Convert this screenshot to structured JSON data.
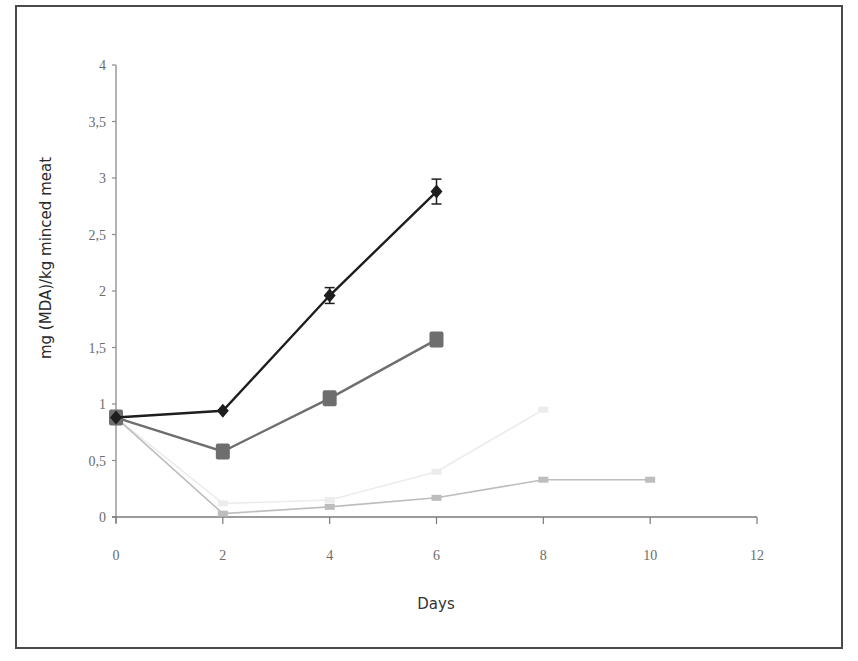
{
  "chart_data": {
    "type": "line",
    "title": "",
    "xlabel": "Days",
    "ylabel": "mg (MDA)/kg  minced meat",
    "xlim": [
      0,
      12
    ],
    "ylim": [
      0,
      4
    ],
    "x_ticks": [
      "0",
      "2",
      "4",
      "6",
      "8",
      "10",
      "12"
    ],
    "y_ticks": [
      "0",
      "0,5",
      "1",
      "1,5",
      "2",
      "2,5",
      "3",
      "3,5",
      "4"
    ],
    "grid": false,
    "legend": null,
    "series": [
      {
        "name": "Series 1 (diamond, black)",
        "marker": "diamond",
        "color": "#1e1e1e",
        "x": [
          0,
          2,
          4,
          6
        ],
        "values": [
          0.88,
          0.94,
          1.96,
          2.88
        ],
        "error": [
          0.02,
          0.03,
          0.07,
          0.11
        ]
      },
      {
        "name": "Series 2 (square, dark gray)",
        "marker": "square",
        "color": "#6e6e6e",
        "x": [
          0,
          2,
          4,
          6
        ],
        "values": [
          0.88,
          0.58,
          1.05,
          1.57
        ],
        "error": [
          0.02,
          0.05,
          0.05,
          0.06
        ]
      },
      {
        "name": "Series 3 (light gray)",
        "marker": "small-square",
        "color": "#bdbdbd",
        "x": [
          0,
          2,
          4,
          6,
          8,
          10
        ],
        "values": [
          0.88,
          0.03,
          0.09,
          0.17,
          0.33,
          0.33
        ],
        "error": [
          0.02,
          0.01,
          0.01,
          0.02,
          0.02,
          0.03
        ]
      },
      {
        "name": "Series 4 (very faint)",
        "marker": "small-square",
        "color": "#ececec",
        "x": [
          0,
          2,
          4,
          6,
          8
        ],
        "values": [
          0.88,
          0.12,
          0.15,
          0.4,
          0.95
        ],
        "error": [
          0.0,
          0.0,
          0.0,
          0.0,
          0.0
        ]
      }
    ]
  }
}
